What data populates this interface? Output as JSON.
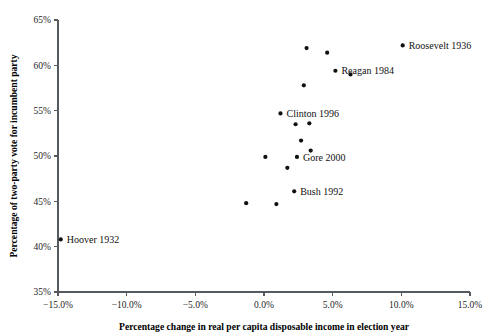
{
  "chart_data": {
    "type": "scatter",
    "title": "",
    "xlabel": "Percentage change in real per capita disposable income in election year",
    "ylabel": "Percentage of two-party vote for incumbent party",
    "xlim": [
      -15.0,
      15.0
    ],
    "ylim": [
      35,
      65
    ],
    "grid": false,
    "legend": "none",
    "xticks": [
      "-15.0%",
      "-10.0%",
      "-5.0%",
      "0.0%",
      "5.0%",
      "10.0%",
      "15.0%"
    ],
    "xtick_values": [
      -15.0,
      -10.0,
      -5.0,
      0.0,
      5.0,
      10.0,
      15.0
    ],
    "yticks": [
      "35%",
      "40%",
      "45%",
      "50%",
      "55%",
      "60%",
      "65%"
    ],
    "ytick_values": [
      35,
      40,
      45,
      50,
      55,
      60,
      65
    ],
    "points": [
      {
        "x": -14.8,
        "y": 40.8,
        "label": "Hoover 1932"
      },
      {
        "x": -1.3,
        "y": 44.8,
        "label": ""
      },
      {
        "x": 0.1,
        "y": 49.9,
        "label": ""
      },
      {
        "x": 0.9,
        "y": 44.7,
        "label": ""
      },
      {
        "x": 1.2,
        "y": 54.7,
        "label": ""
      },
      {
        "x": 1.7,
        "y": 48.7,
        "label": ""
      },
      {
        "x": 2.2,
        "y": 46.1,
        "label": "Bush 1992"
      },
      {
        "x": 2.3,
        "y": 53.5,
        "label": ""
      },
      {
        "x": 2.4,
        "y": 49.9,
        "label": "Gore 2000"
      },
      {
        "x": 2.7,
        "y": 51.7,
        "label": ""
      },
      {
        "x": 2.9,
        "y": 57.8,
        "label": ""
      },
      {
        "x": 3.1,
        "y": 61.9,
        "label": ""
      },
      {
        "x": 3.3,
        "y": 53.6,
        "label": ""
      },
      {
        "x": 3.4,
        "y": 50.6,
        "label": ""
      },
      {
        "x": 4.6,
        "y": 61.4,
        "label": ""
      },
      {
        "x": 5.2,
        "y": 59.4,
        "label": "Reagan 1984"
      },
      {
        "x": 6.3,
        "y": 59.0,
        "label": ""
      },
      {
        "x": 10.1,
        "y": 62.2,
        "label": "Roosevelt 1936"
      }
    ],
    "annotations": [
      {
        "text": "Roosevelt 1936",
        "x": 10.1,
        "y": 62.2
      },
      {
        "text": "Reagan 1984",
        "x": 5.2,
        "y": 59.4
      },
      {
        "text": "Clinton 1996",
        "x": 1.2,
        "y": 54.7
      },
      {
        "text": "Gore 2000",
        "x": 2.4,
        "y": 49.9
      },
      {
        "text": "Bush 1992",
        "x": 2.2,
        "y": 46.1
      },
      {
        "text": "Hoover 1932",
        "x": -14.8,
        "y": 40.8
      }
    ]
  },
  "colors": {
    "marker": "#111111",
    "axis": "#555a5e",
    "text": "#111111",
    "background": "#ffffff"
  }
}
